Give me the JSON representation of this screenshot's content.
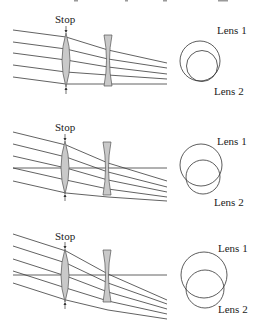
{
  "figure": {
    "colors": {
      "ray": "#3a3a3a",
      "lens_fill": "#c9c9c9",
      "lens_stroke": "#555555",
      "circle": "#333333",
      "text": "#222222"
    },
    "panels": [
      {
        "id": "on-axis",
        "stop_label": "Stop",
        "lens1_label": "Lens 1",
        "lens2_label": "Lens 2",
        "has_axis_line": false
      },
      {
        "id": "mid-field",
        "stop_label": "Stop",
        "lens1_label": "Lens 1",
        "lens2_label": "Lens 2",
        "has_axis_line": true
      },
      {
        "id": "full-field",
        "stop_label": "Stop",
        "lens1_label": "Lens 1",
        "lens2_label": "Lens 2",
        "has_axis_line": true
      }
    ]
  }
}
